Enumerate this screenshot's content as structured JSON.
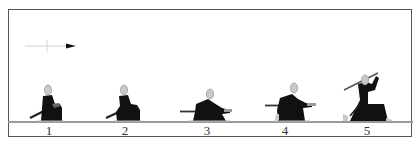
{
  "figure": {
    "direction_arrow": {
      "icon": "arrow-right-icon",
      "color": "#111111",
      "line_color": "#c8c8c8"
    },
    "colors": {
      "robe": "#111111",
      "head": "#c9c9c9",
      "sword": "#333333",
      "frame": "#555555",
      "ground": "#9a9a9a"
    },
    "steps": [
      {
        "number": "1",
        "pose": "seated-hand-on-hilt",
        "center_x": 49
      },
      {
        "number": "2",
        "pose": "seated-hand-on-hilt-leaning",
        "center_x": 125
      },
      {
        "number": "3",
        "pose": "kneeling-drawing-sword",
        "center_x": 207
      },
      {
        "number": "4",
        "pose": "kneeling-sword-drawn-forward",
        "center_x": 285
      },
      {
        "number": "5",
        "pose": "kneeling-sword-raised-overhead",
        "center_x": 367
      }
    ]
  }
}
